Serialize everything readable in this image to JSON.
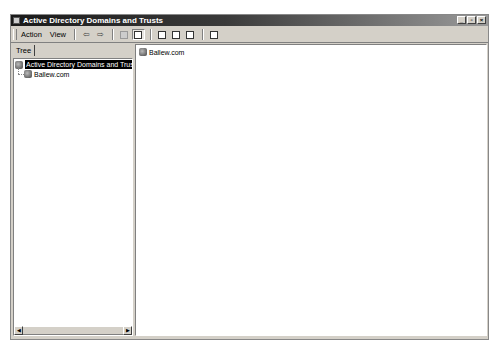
{
  "window": {
    "title": "Active Directory Domains and Trusts",
    "controls": {
      "minimize": "_",
      "maximize": "▫",
      "close": "×"
    }
  },
  "menubar": {
    "items": [
      {
        "label": "Action",
        "mnemonic": "A"
      },
      {
        "label": "View",
        "mnemonic": "V"
      }
    ]
  },
  "toolbar": {
    "buttons": [
      {
        "name": "back",
        "icon": "back-arrow-icon",
        "glyph": "⇦"
      },
      {
        "name": "forward",
        "icon": "forward-arrow-icon",
        "glyph": "⇨"
      },
      {
        "name": "up-one-level",
        "icon": "folder-up-icon"
      },
      {
        "name": "show-hide-console-tree",
        "icon": "console-tree-icon",
        "pressed": true
      },
      {
        "name": "properties",
        "icon": "properties-icon"
      },
      {
        "name": "refresh",
        "icon": "refresh-icon"
      },
      {
        "name": "export-list",
        "icon": "export-list-icon"
      },
      {
        "name": "help",
        "icon": "help-icon"
      }
    ]
  },
  "tree": {
    "tab_label": "Tree",
    "root": {
      "label": "Active Directory Domains and Trusts",
      "selected": true
    },
    "children": [
      {
        "label": "Ballew.com"
      }
    ]
  },
  "list": {
    "items": [
      {
        "label": "Ballew.com"
      }
    ]
  },
  "scrollbar": {
    "left_arrow": "◀",
    "right_arrow": "▶"
  }
}
